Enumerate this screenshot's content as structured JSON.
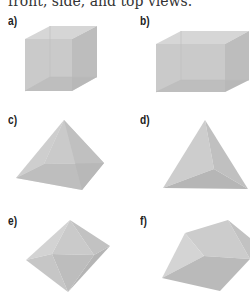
{
  "caption": "front, side, and top views.",
  "figures": [
    {
      "label": "a)",
      "shape": "cube"
    },
    {
      "label": "b)",
      "shape": "rectangular-prism"
    },
    {
      "label": "c)",
      "shape": "square-pyramid"
    },
    {
      "label": "d)",
      "shape": "triangular-pyramid"
    },
    {
      "label": "e)",
      "shape": "octahedron"
    },
    {
      "label": "f)",
      "shape": "triangular-prism"
    }
  ],
  "colors": {
    "face_light": "#d4d4d4",
    "face_mid": "#c6c6c6",
    "face_dark": "#b8b8b8",
    "face_darker": "#adadad"
  }
}
